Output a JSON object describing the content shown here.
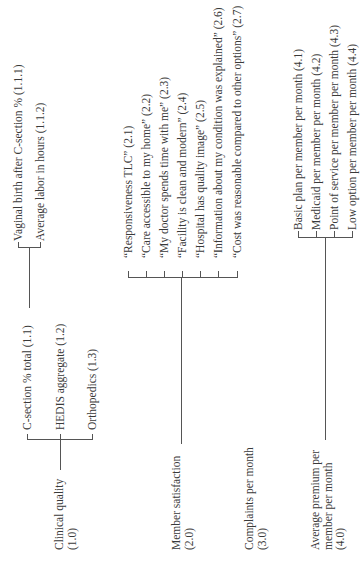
{
  "diagram": {
    "orientation": "rotated-90-ccw",
    "nodes": [
      {
        "id": "1.0",
        "label_line1": "Clinical quality",
        "label_line2": "(1.0)",
        "children": [
          {
            "id": "1.1",
            "label": "C-section % total (1.1)",
            "children": [
              {
                "id": "1.1.1",
                "label": "Vaginal birth after C-section % (1.1.1)"
              },
              {
                "id": "1.1.2",
                "label": "Average labor in hours (1.1.2)"
              }
            ]
          },
          {
            "id": "1.2",
            "label": "HEDIS aggregate (1.2)"
          },
          {
            "id": "1.3",
            "label": "Orthopedics (1.3)"
          }
        ]
      },
      {
        "id": "2.0",
        "label_line1": "Member satisfaction",
        "label_line2": "(2.0)",
        "children": [
          {
            "id": "2.1",
            "label": "“Responsiveness TLC”  (2.1)"
          },
          {
            "id": "2.2",
            "label": "“Care accessible to my home” (2.2)"
          },
          {
            "id": "2.3",
            "label": "“My doctor spends time with me” (2.3)"
          },
          {
            "id": "2.4",
            "label": "“Facility is clean and modern” (2.4)"
          },
          {
            "id": "2.5",
            "label": "“Hospital has quality image” (2.5)"
          },
          {
            "id": "2.6",
            "label": "“Information about my condition was explained” (2.6)"
          },
          {
            "id": "2.7",
            "label": "“Cost was reasonable compared to other options” (2.7)"
          }
        ]
      },
      {
        "id": "3.0",
        "label_line1": "Complaints per month",
        "label_line2": "(3.0)",
        "children": []
      },
      {
        "id": "4.0",
        "label_line1": "Average premium per",
        "label_line2": "member per month",
        "label_line3": "(4.0)",
        "children": [
          {
            "id": "4.1",
            "label": "Basic plan per member per month (4.1)"
          },
          {
            "id": "4.2",
            "label": "Medicaid per member per month (4.2)"
          },
          {
            "id": "4.3",
            "label": "Point of service per member per month (4.3)"
          },
          {
            "id": "4.4",
            "label": "Low option per member per month (4.4)"
          }
        ]
      }
    ]
  }
}
